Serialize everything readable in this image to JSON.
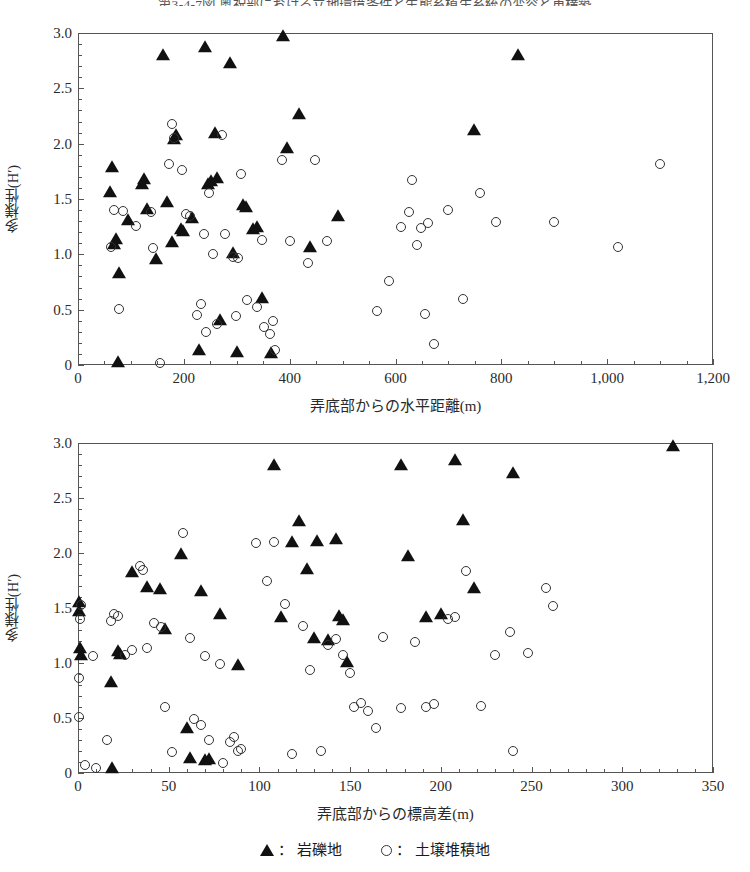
{
  "caption": "第3-4-7図 奥祝部における立地環境条件と生態系植生系統の変容と再構築",
  "legend": {
    "entries": [
      {
        "marker": "filled-triangle",
        "separator": "：",
        "label": "岩礫地"
      },
      {
        "marker": "open-circle",
        "separator": "：",
        "label": "土壌堆積地"
      }
    ]
  },
  "chart_data": [
    {
      "type": "scatter",
      "title": "",
      "xlabel": "弄底部からの水平距離(m)",
      "ylabel": "多様性(H′)",
      "xlim": [
        0,
        1200
      ],
      "ylim": [
        0,
        3.0
      ],
      "xticks": [
        0,
        200,
        400,
        600,
        800,
        1000,
        1200
      ],
      "xtick_labels": [
        "0",
        "200",
        "400",
        "600",
        "800",
        "1,000",
        "1,200"
      ],
      "yticks": [
        0,
        0.5,
        1.0,
        1.5,
        2.0,
        2.5,
        3.0
      ],
      "ytick_labels": [
        "0",
        "0.5",
        "1.0",
        "1.5",
        "2.0",
        "2.5",
        "3.0"
      ],
      "x_minor_interval": 50,
      "y_minor_interval": 0.1,
      "grid": false,
      "legend_position": "below-figure",
      "series": [
        {
          "name": "岩礫地",
          "marker": "filled-triangle",
          "points": [
            [
              75,
              0.02
            ],
            [
              60,
              1.55
            ],
            [
              65,
              1.78
            ],
            [
              68,
              1.08
            ],
            [
              72,
              1.13
            ],
            [
              78,
              0.82
            ],
            [
              95,
              1.3
            ],
            [
              120,
              1.63
            ],
            [
              125,
              1.67
            ],
            [
              130,
              1.4
            ],
            [
              148,
              0.95
            ],
            [
              160,
              2.79
            ],
            [
              168,
              1.46
            ],
            [
              178,
              1.1
            ],
            [
              182,
              2.03
            ],
            [
              186,
              2.07
            ],
            [
              195,
              1.22
            ],
            [
              198,
              1.2
            ],
            [
              215,
              1.32
            ],
            [
              228,
              0.13
            ],
            [
              240,
              2.86
            ],
            [
              245,
              1.63
            ],
            [
              252,
              1.65
            ],
            [
              258,
              2.09
            ],
            [
              262,
              1.68
            ],
            [
              268,
              0.4
            ],
            [
              288,
              2.72
            ],
            [
              292,
              1.0
            ],
            [
              300,
              0.11
            ],
            [
              312,
              1.44
            ],
            [
              318,
              1.42
            ],
            [
              330,
              1.22
            ],
            [
              338,
              1.24
            ],
            [
              348,
              0.6
            ],
            [
              365,
              0.1
            ],
            [
              388,
              2.96
            ],
            [
              395,
              1.95
            ],
            [
              418,
              2.26
            ],
            [
              438,
              1.06
            ],
            [
              492,
              1.34
            ],
            [
              748,
              2.11
            ],
            [
              832,
              2.79
            ]
          ]
        },
        {
          "name": "土壌堆積地",
          "marker": "open-circle",
          "points": [
            [
              62,
              1.07
            ],
            [
              68,
              1.4
            ],
            [
              78,
              0.51
            ],
            [
              85,
              1.39
            ],
            [
              110,
              1.26
            ],
            [
              138,
              1.38
            ],
            [
              142,
              1.06
            ],
            [
              155,
              0.02
            ],
            [
              172,
              1.82
            ],
            [
              178,
              2.18
            ],
            [
              182,
              2.05
            ],
            [
              196,
              1.76
            ],
            [
              205,
              1.36
            ],
            [
              212,
              1.35
            ],
            [
              225,
              0.45
            ],
            [
              232,
              0.55
            ],
            [
              238,
              1.18
            ],
            [
              242,
              0.3
            ],
            [
              248,
              1.55
            ],
            [
              255,
              1.0
            ],
            [
              262,
              0.37
            ],
            [
              272,
              2.08
            ],
            [
              278,
              1.18
            ],
            [
              292,
              0.98
            ],
            [
              298,
              0.44
            ],
            [
              302,
              0.97
            ],
            [
              308,
              1.73
            ],
            [
              320,
              0.59
            ],
            [
              338,
              0.52
            ],
            [
              348,
              1.13
            ],
            [
              352,
              0.34
            ],
            [
              362,
              0.28
            ],
            [
              368,
              0.4
            ],
            [
              372,
              0.14
            ],
            [
              385,
              1.85
            ],
            [
              400,
              1.12
            ],
            [
              435,
              0.92
            ],
            [
              448,
              1.85
            ],
            [
              470,
              1.12
            ],
            [
              565,
              0.49
            ],
            [
              588,
              0.76
            ],
            [
              610,
              1.25
            ],
            [
              625,
              1.38
            ],
            [
              632,
              1.67
            ],
            [
              640,
              1.08
            ],
            [
              648,
              1.24
            ],
            [
              655,
              0.46
            ],
            [
              662,
              1.28
            ],
            [
              672,
              0.19
            ],
            [
              700,
              1.4
            ],
            [
              728,
              0.6
            ],
            [
              760,
              1.55
            ],
            [
              790,
              1.29
            ],
            [
              900,
              1.29
            ],
            [
              1020,
              1.07
            ],
            [
              1100,
              1.82
            ]
          ]
        }
      ]
    },
    {
      "type": "scatter",
      "title": "",
      "xlabel": "弄底部からの標高差(m)",
      "ylabel": "多様性(H′)",
      "xlim": [
        0,
        350
      ],
      "ylim": [
        0,
        3.0
      ],
      "xticks": [
        0,
        50,
        100,
        150,
        200,
        250,
        300,
        350
      ],
      "xtick_labels": [
        "0",
        "50",
        "100",
        "150",
        "200",
        "250",
        "300",
        "350"
      ],
      "yticks": [
        0,
        0.5,
        1.0,
        1.5,
        2.0,
        2.5,
        3.0
      ],
      "ytick_labels": [
        "0",
        "0.5",
        "1.0",
        "1.5",
        "2.0",
        "2.5",
        "3.0"
      ],
      "x_minor_interval": 10,
      "y_minor_interval": 0.1,
      "grid": false,
      "legend_position": "below-figure",
      "series": [
        {
          "name": "岩礫地",
          "marker": "filled-triangle",
          "points": [
            [
              0.5,
              1.55
            ],
            [
              0.5,
              1.46
            ],
            [
              1,
              1.13
            ],
            [
              1.5,
              1.06
            ],
            [
              18,
              0.82
            ],
            [
              19,
              0.04
            ],
            [
              22,
              1.1
            ],
            [
              23,
              1.07
            ],
            [
              30,
              1.82
            ],
            [
              38,
              1.68
            ],
            [
              45,
              1.66
            ],
            [
              48,
              1.3
            ],
            [
              57,
              1.98
            ],
            [
              60,
              0.4
            ],
            [
              62,
              0.13
            ],
            [
              68,
              1.65
            ],
            [
              70,
              0.11
            ],
            [
              72,
              0.12
            ],
            [
              78,
              1.44
            ],
            [
              88,
              0.97
            ],
            [
              108,
              2.79
            ],
            [
              112,
              1.41
            ],
            [
              118,
              2.09
            ],
            [
              122,
              2.28
            ],
            [
              126,
              1.85
            ],
            [
              130,
              1.22
            ],
            [
              132,
              2.1
            ],
            [
              138,
              1.2
            ],
            [
              142,
              2.12
            ],
            [
              144,
              1.42
            ],
            [
              146,
              1.38
            ],
            [
              148,
              1.0
            ],
            [
              178,
              2.79
            ],
            [
              182,
              1.96
            ],
            [
              192,
              1.41
            ],
            [
              200,
              1.44
            ],
            [
              208,
              2.84
            ],
            [
              212,
              2.29
            ],
            [
              218,
              1.67
            ],
            [
              240,
              2.72
            ],
            [
              328,
              2.96
            ]
          ]
        },
        {
          "name": "土壌堆積地",
          "marker": "open-circle",
          "points": [
            [
              0.5,
              0.86
            ],
            [
              0.5,
              0.51
            ],
            [
              1,
              1.4
            ],
            [
              1.5,
              1.53
            ],
            [
              4,
              0.07
            ],
            [
              8,
              1.06
            ],
            [
              10,
              0.05
            ],
            [
              16,
              0.3
            ],
            [
              18,
              1.38
            ],
            [
              20,
              1.45
            ],
            [
              22,
              1.43
            ],
            [
              26,
              1.07
            ],
            [
              30,
              1.12
            ],
            [
              34,
              1.88
            ],
            [
              36,
              1.85
            ],
            [
              38,
              1.14
            ],
            [
              42,
              1.36
            ],
            [
              46,
              1.33
            ],
            [
              48,
              0.6
            ],
            [
              52,
              0.19
            ],
            [
              58,
              2.18
            ],
            [
              62,
              1.23
            ],
            [
              64,
              0.49
            ],
            [
              68,
              0.44
            ],
            [
              70,
              1.06
            ],
            [
              72,
              0.3
            ],
            [
              78,
              0.99
            ],
            [
              80,
              0.09
            ],
            [
              84,
              0.28
            ],
            [
              86,
              0.33
            ],
            [
              88,
              0.2
            ],
            [
              90,
              0.22
            ],
            [
              98,
              2.09
            ],
            [
              104,
              1.75
            ],
            [
              108,
              2.1
            ],
            [
              114,
              1.54
            ],
            [
              118,
              0.17
            ],
            [
              124,
              1.34
            ],
            [
              128,
              0.94
            ],
            [
              134,
              0.2
            ],
            [
              138,
              1.16
            ],
            [
              142,
              1.22
            ],
            [
              146,
              1.07
            ],
            [
              150,
              0.91
            ],
            [
              152,
              0.6
            ],
            [
              156,
              0.64
            ],
            [
              160,
              0.56
            ],
            [
              164,
              0.41
            ],
            [
              168,
              1.24
            ],
            [
              178,
              0.59
            ],
            [
              186,
              1.19
            ],
            [
              192,
              0.6
            ],
            [
              196,
              0.63
            ],
            [
              204,
              1.4
            ],
            [
              208,
              1.42
            ],
            [
              214,
              1.84
            ],
            [
              222,
              0.61
            ],
            [
              230,
              1.07
            ],
            [
              238,
              1.28
            ],
            [
              240,
              0.2
            ],
            [
              248,
              1.09
            ],
            [
              258,
              1.68
            ],
            [
              262,
              1.52
            ]
          ]
        }
      ]
    }
  ]
}
